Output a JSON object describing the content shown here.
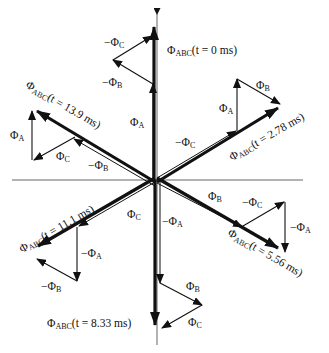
{
  "figure": {
    "type": "phasor diagram",
    "colors": {
      "ink": "#111111",
      "axis": "#555555",
      "background": "#ffffff"
    }
  },
  "symbols": {
    "phi": "Φ",
    "minus": "−"
  },
  "resultants": [
    {
      "id": "t0",
      "prefix": "Φ",
      "sub": "ABC",
      "text": "(t = 0 ms)"
    },
    {
      "id": "t278",
      "prefix": "Φ",
      "sub": "ABC",
      "text": "(t = 2.78 ms)"
    },
    {
      "id": "t556",
      "prefix": "Φ",
      "sub": "ABC",
      "text": "(t = 5.56 ms)"
    },
    {
      "id": "t833",
      "prefix": "Φ",
      "sub": "ABC",
      "text": "(t = 8.33 ms)"
    },
    {
      "id": "t111",
      "prefix": "Φ",
      "sub": "ABC",
      "text": "(t = 11.1 ms)"
    },
    {
      "id": "t139",
      "prefix": "Φ",
      "sub": "ABC",
      "text": "(t = 13.9 ms)"
    }
  ],
  "components": {
    "t0": [
      {
        "sign": "",
        "sub": "A"
      },
      {
        "sign": "−",
        "sub": "B"
      },
      {
        "sign": "−",
        "sub": "C"
      }
    ],
    "t278": [
      {
        "sign": "−",
        "sub": "C"
      },
      {
        "sign": "",
        "sub": "A"
      },
      {
        "sign": "",
        "sub": "B"
      }
    ],
    "t556": [
      {
        "sign": "",
        "sub": "B"
      },
      {
        "sign": "−",
        "sub": "C"
      },
      {
        "sign": "−",
        "sub": "A"
      }
    ],
    "t833": [
      {
        "sign": "−",
        "sub": "A"
      },
      {
        "sign": "",
        "sub": "B"
      },
      {
        "sign": "",
        "sub": "C"
      }
    ],
    "t111": [
      {
        "sign": "",
        "sub": "C"
      },
      {
        "sign": "−",
        "sub": "A"
      },
      {
        "sign": "−",
        "sub": "B"
      }
    ],
    "t139": [
      {
        "sign": "−",
        "sub": "B"
      },
      {
        "sign": "",
        "sub": "C"
      },
      {
        "sign": "",
        "sub": "A"
      }
    ]
  }
}
